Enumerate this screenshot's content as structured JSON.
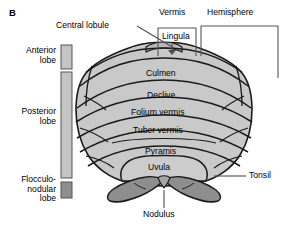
{
  "figure": {
    "panel_letter": "B"
  },
  "colors": {
    "body_fill": "#c9c9c9",
    "body_fill_light": "#d2d2d2",
    "outline": "#1a1a1a",
    "bar_light": "#c4c4c4",
    "bar_dark": "#8e8e8e",
    "tonsil_fill": "#8e8e8e",
    "leader": "#4d4d4d",
    "background": "#ffffff"
  },
  "labels": {
    "central_lobule": "Central lobule",
    "vermis": "Vermis",
    "hemisphere": "Hemisphere",
    "lingula": "Lingula",
    "culmen": "Culmen",
    "declive": "Declive",
    "folium_vermis": "Folium vermis",
    "tuber_vermis": "Tuber vermis",
    "pyramis": "Pyramis",
    "uvula": "Uvula",
    "nodulus": "Nodulus",
    "tonsil": "Tonsil"
  },
  "lobes": [
    {
      "id": "anterior",
      "line1": "Anterior",
      "line2": "lobe",
      "line3": "",
      "swatch": "light"
    },
    {
      "id": "posterior",
      "line1": "Posterior",
      "line2": "lobe",
      "line3": "",
      "swatch": "light"
    },
    {
      "id": "flocculonodular",
      "line1": "Flocculo-",
      "line2": "nodular",
      "line3": "lobe",
      "swatch": "dark"
    }
  ]
}
